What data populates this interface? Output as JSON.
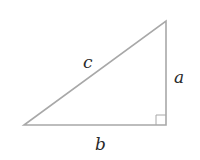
{
  "diagram": {
    "type": "right-triangle",
    "colors": {
      "stroke": "#a8a8a8",
      "label": "#2a2a2a",
      "background": "#ffffff"
    },
    "labels": {
      "hypotenuse": "c",
      "vertical_leg": "a",
      "horizontal_leg": "b"
    },
    "right_angle_marker": true
  }
}
